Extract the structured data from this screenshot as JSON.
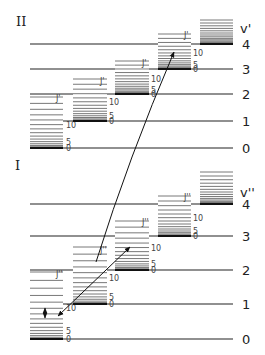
{
  "sections": [
    {
      "id": "upper",
      "roman_label": "II",
      "roman_pos": [
        16,
        26
      ],
      "axis_label": "v'",
      "axis_label_pos": [
        240,
        33
      ],
      "rot_label": "J'",
      "line_x1": 30,
      "line_x2": 233,
      "label_x": 242,
      "levels": [
        {
          "v": "0",
          "y": 148
        },
        {
          "v": "1",
          "y": 121
        },
        {
          "v": "2",
          "y": 94
        },
        {
          "v": "3",
          "y": 69
        },
        {
          "v": "4",
          "y": 44
        }
      ],
      "stacks": [
        {
          "x1": 30,
          "x2": 63,
          "base_y": 148,
          "top_y": 97,
          "label_x": 66,
          "marks": [
            "0",
            "5",
            "10"
          ],
          "j_label_at": 99
        },
        {
          "x1": 73,
          "x2": 107,
          "base_y": 121,
          "top_y": 79,
          "label_x": 109,
          "marks": [
            "0",
            "5",
            "10"
          ],
          "j_label_at": 82
        },
        {
          "x1": 115,
          "x2": 149,
          "base_y": 94,
          "top_y": 61,
          "label_x": 151,
          "marks": [
            "0",
            "5",
            "10"
          ],
          "j_label_at": 64
        },
        {
          "x1": 158,
          "x2": 191,
          "base_y": 69,
          "top_y": 34,
          "label_x": 193,
          "marks": [
            "0",
            "5",
            "10"
          ],
          "j_label_at": 36
        },
        {
          "x1": 200,
          "x2": 233,
          "base_y": 44,
          "top_y": 20,
          "label_x": 0,
          "marks": [],
          "j_label_at": 0
        }
      ]
    },
    {
      "id": "lower",
      "roman_label": "I",
      "roman_pos": [
        15,
        170
      ],
      "axis_label": "v''",
      "axis_label_pos": [
        240,
        197
      ],
      "rot_label": "J''",
      "line_x1": 30,
      "line_x2": 233,
      "label_x": 242,
      "levels": [
        {
          "v": "0",
          "y": 339
        },
        {
          "v": "1",
          "y": 304
        },
        {
          "v": "2",
          "y": 270
        },
        {
          "v": "3",
          "y": 236
        },
        {
          "v": "4",
          "y": 204
        }
      ],
      "stacks": [
        {
          "x1": 30,
          "x2": 63,
          "base_y": 339,
          "top_y": 272,
          "label_x": 66,
          "marks": [
            "0",
            "5",
            "10"
          ],
          "j_label_at": 275
        },
        {
          "x1": 73,
          "x2": 107,
          "base_y": 304,
          "top_y": 247,
          "label_x": 109,
          "marks": [
            "0",
            "5",
            "10"
          ],
          "j_label_at": 251
        },
        {
          "x1": 115,
          "x2": 149,
          "base_y": 270,
          "top_y": 221,
          "label_x": 151,
          "marks": [
            "0",
            "5",
            "10"
          ],
          "j_label_at": 223
        },
        {
          "x1": 158,
          "x2": 191,
          "base_y": 236,
          "top_y": 196,
          "label_x": 193,
          "marks": [
            "0",
            "5",
            "10"
          ],
          "j_label_at": 198
        },
        {
          "x1": 200,
          "x2": 233,
          "base_y": 204,
          "top_y": 172,
          "label_x": 0,
          "marks": [],
          "j_label_at": 0
        }
      ]
    }
  ],
  "arrows": [
    {
      "name": "absorption-arrow",
      "x1": 96,
      "y1": 262,
      "x2": 174,
      "y2": 52,
      "head": "end",
      "curve": true
    },
    {
      "name": "emission-arrow-up",
      "x1": 58,
      "y1": 316,
      "x2": 130,
      "y2": 247,
      "head": "both",
      "curve": false
    },
    {
      "name": "small-double-arrow",
      "x1": 45,
      "y1": 308,
      "x2": 45,
      "y2": 318,
      "head": "both",
      "curve": false
    }
  ]
}
